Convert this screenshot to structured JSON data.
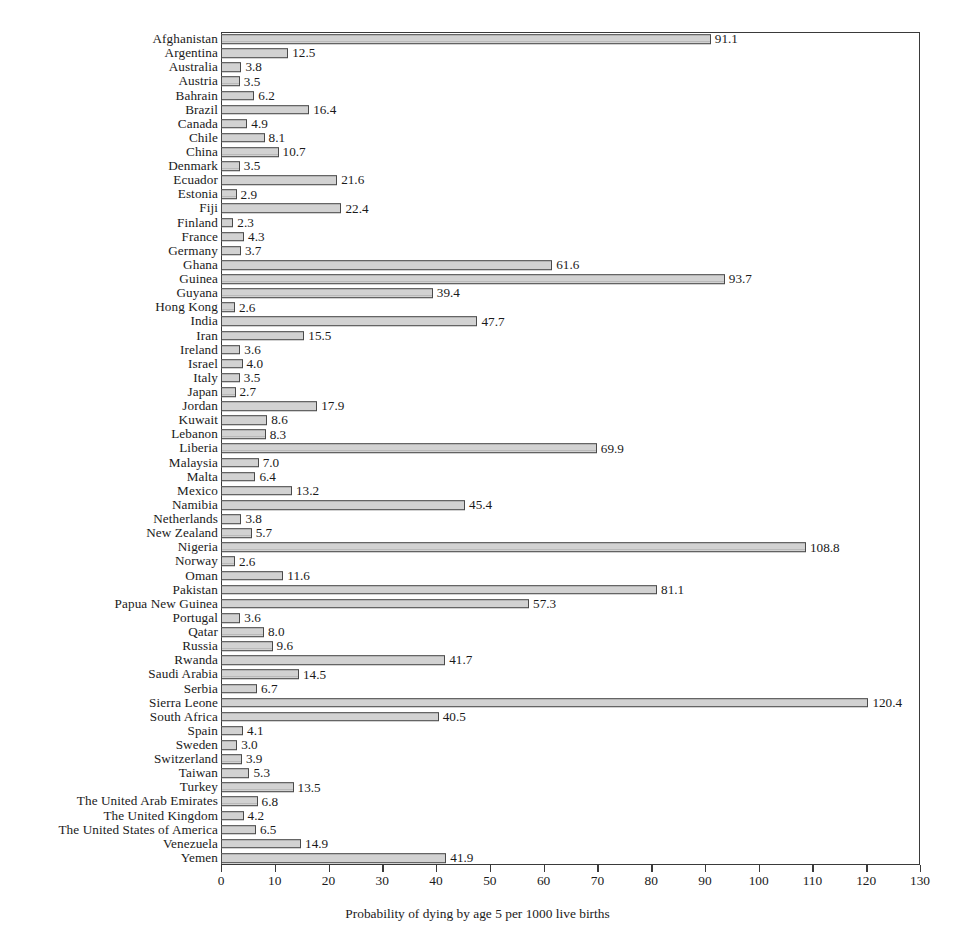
{
  "chart_data": {
    "type": "bar",
    "orientation": "horizontal",
    "title": "",
    "subtitle": "",
    "xlabel": "Probability of dying by age 5 per 1000 live births",
    "ylabel": "",
    "xlim": [
      0,
      130
    ],
    "xticks": [
      0,
      10,
      20,
      30,
      40,
      50,
      60,
      70,
      80,
      90,
      100,
      110,
      120,
      130
    ],
    "grid": false,
    "legend": null,
    "value_labels": true,
    "bar_fill": "#c9c9c9",
    "bar_border": "#4a4a4a",
    "categories": [
      "Afghanistan",
      "Argentina",
      "Australia",
      "Austria",
      "Bahrain",
      "Brazil",
      "Canada",
      "Chile",
      "China",
      "Denmark",
      "Ecuador",
      "Estonia",
      "Fiji",
      "Finland",
      "France",
      "Germany",
      "Ghana",
      "Guinea",
      "Guyana",
      "Hong Kong",
      "India",
      "Iran",
      "Ireland",
      "Israel",
      "Italy",
      "Japan",
      "Jordan",
      "Kuwait",
      "Lebanon",
      "Liberia",
      "Malaysia",
      "Malta",
      "Mexico",
      "Namibia",
      "Netherlands",
      "New Zealand",
      "Nigeria",
      "Norway",
      "Oman",
      "Pakistan",
      "Papua New Guinea",
      "Portugal",
      "Qatar",
      "Russia",
      "Rwanda",
      "Saudi Arabia",
      "Serbia",
      "Sierra Leone",
      "South Africa",
      "Spain",
      "Sweden",
      "Switzerland",
      "Taiwan",
      "Turkey",
      "The United Arab Emirates",
      "The United Kingdom",
      "The United States of America",
      "Venezuela",
      "Yemen"
    ],
    "values": [
      91.1,
      12.5,
      3.8,
      3.5,
      6.2,
      16.4,
      4.9,
      8.1,
      10.7,
      3.5,
      21.6,
      2.9,
      22.4,
      2.3,
      4.3,
      3.7,
      61.6,
      93.7,
      39.4,
      2.6,
      47.7,
      15.5,
      3.6,
      4.0,
      3.5,
      2.7,
      17.9,
      8.6,
      8.3,
      69.9,
      7.0,
      6.4,
      13.2,
      45.4,
      3.8,
      5.7,
      108.8,
      2.6,
      11.6,
      81.1,
      57.3,
      3.6,
      8.0,
      9.6,
      41.7,
      14.5,
      6.7,
      120.4,
      40.5,
      4.1,
      3.0,
      3.9,
      5.3,
      13.5,
      6.8,
      4.2,
      6.5,
      14.9,
      41.9
    ],
    "value_label_text": [
      "91.1",
      "12.5",
      "3.8",
      "3.5",
      "6.2",
      "16.4",
      "4.9",
      "8.1",
      "10.7",
      "3.5",
      "21.6",
      "2.9",
      "22.4",
      "2.3",
      "4.3",
      "3.7",
      "61.6",
      "93.7",
      "39.4",
      "2.6",
      "47.7",
      "15.5",
      "3.6",
      "4.0",
      "3.5",
      "2.7",
      "17.9",
      "8.6",
      "8.3",
      "69.9",
      "7.0",
      "6.4",
      "13.2",
      "45.4",
      "3.8",
      "5.7",
      "108.8",
      "2.6",
      "11.6",
      "81.1",
      "57.3",
      "3.6",
      "8.0",
      "9.6",
      "41.7",
      "14.5",
      "6.7",
      "120.4",
      "40.5",
      "4.1",
      "3.0",
      "3.9",
      "5.3",
      "13.5",
      "6.8",
      "4.2",
      "6.5",
      "14.9",
      "41.9"
    ]
  }
}
